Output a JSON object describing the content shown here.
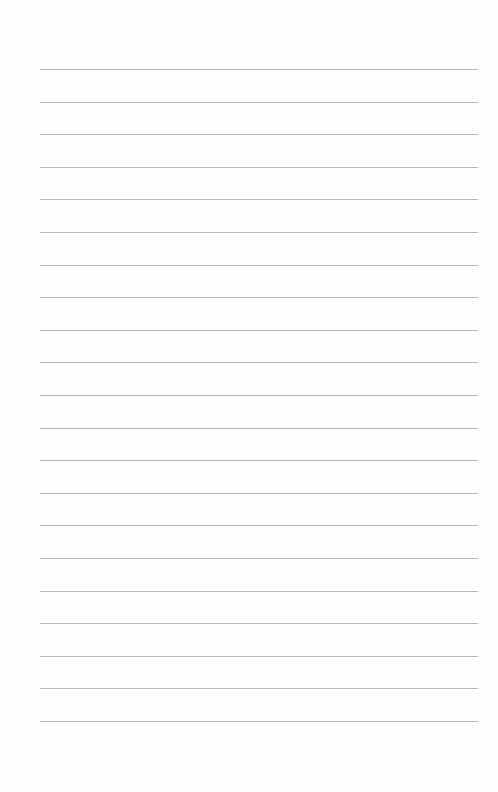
{
  "page": {
    "type": "lined-paper",
    "background_color": "#fefefe",
    "line_color": "#b9b9b9",
    "line_count": 21,
    "first_line_y": 69,
    "line_spacing": 32.6,
    "line_left": 40,
    "line_width": 438,
    "text_content": []
  }
}
